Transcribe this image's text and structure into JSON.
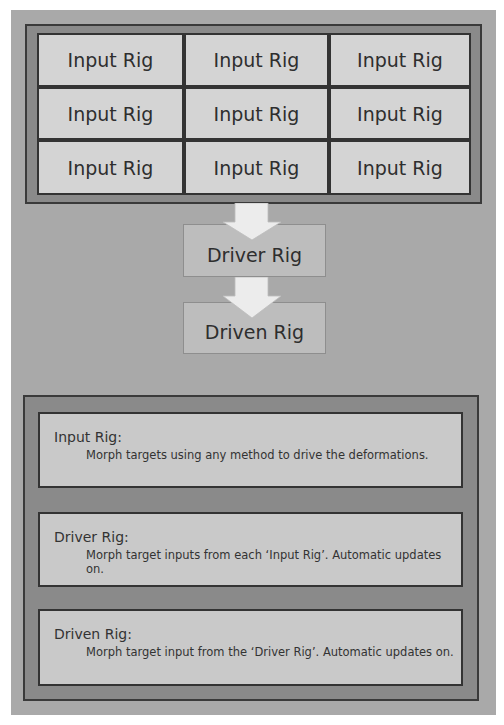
{
  "diagram": {
    "input_grid": {
      "rows": [
        [
          "Input Rig",
          "Input Rig",
          "Input Rig"
        ],
        [
          "Input Rig",
          "Input Rig",
          "Input Rig"
        ],
        [
          "Input Rig",
          "Input Rig",
          "Input Rig"
        ]
      ]
    },
    "flow": [
      {
        "label": "Driver Rig"
      },
      {
        "label": "Driven Rig"
      }
    ],
    "arrows": [
      {
        "from": "Input Rig grid",
        "to": "Driver Rig",
        "icon": "down-arrow-icon"
      },
      {
        "from": "Driver Rig",
        "to": "Driven Rig",
        "icon": "down-arrow-icon"
      }
    ]
  },
  "legend": {
    "items": [
      {
        "title": "Input Rig:",
        "description": "Morph targets using any method to drive the deformations."
      },
      {
        "title": "Driver Rig:",
        "description": "Morph target inputs from each ‘Input Rig’. Automatic updates on."
      },
      {
        "title": "Driven Rig:",
        "description": "Morph target input from the ‘Driver Rig’. Automatic updates on."
      }
    ]
  },
  "colors": {
    "background": "#a9a9a9",
    "frame": "#8a8a8a",
    "frame_border": "#3a3a3a",
    "cell": "#d4d4d4",
    "flow_box": "#bdbdbd",
    "info_box": "#c9c9c9",
    "arrow": "#ececec"
  }
}
